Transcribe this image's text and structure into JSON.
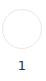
{
  "step": {
    "number": "1",
    "colors": {
      "circle_border": "#e8e8e8",
      "circle_fill": "#ffffff",
      "label": "#333333"
    }
  }
}
